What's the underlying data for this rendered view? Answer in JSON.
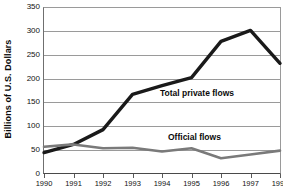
{
  "chart_data": {
    "type": "line",
    "title": "",
    "xlabel": "",
    "ylabel": "Billions of U.S. Dollars",
    "categories": [
      "1990",
      "1991",
      "1992",
      "1993",
      "1994",
      "1995",
      "1996",
      "1997",
      "1998"
    ],
    "x": [
      1990,
      1991,
      1992,
      1993,
      1994,
      1995,
      1996,
      1997,
      1998
    ],
    "series": [
      {
        "name": "Total private flows",
        "color": "#1a1a1a",
        "values": [
          45,
          62,
          93,
          167,
          185,
          202,
          278,
          301,
          232
        ]
      },
      {
        "name": "Official flows",
        "color": "#7a7a7a",
        "values": [
          57,
          62,
          54,
          55,
          47,
          54,
          33,
          41,
          49
        ]
      }
    ],
    "ylim": [
      0,
      350
    ],
    "ytick_step": 50,
    "yticks": [
      "0",
      "50",
      "100",
      "150",
      "200",
      "250",
      "300",
      "350"
    ],
    "grid": true,
    "legend": "inline-annotations",
    "annotations": [
      {
        "text": "Total private flows",
        "series": "Total private flows"
      },
      {
        "text": "Official flows",
        "series": "Official flows"
      }
    ]
  },
  "axis": {
    "y_title": "Billions of U.S. Dollars",
    "y_tick_labels": [
      "350",
      "300",
      "250",
      "200",
      "150",
      "100",
      "50",
      "0"
    ],
    "x_tick_labels": [
      "1990",
      "1991",
      "1992",
      "1993",
      "1994",
      "1995",
      "1996",
      "1997",
      "1998"
    ]
  },
  "annotations": {
    "private_label": "Total private flows",
    "official_label": "Official flows"
  },
  "colors": {
    "private_line": "#1a1a1a",
    "official_line": "#7a7a7a",
    "grid": "#9a9a9a",
    "axis_text": "#111111",
    "background": "#ffffff"
  }
}
